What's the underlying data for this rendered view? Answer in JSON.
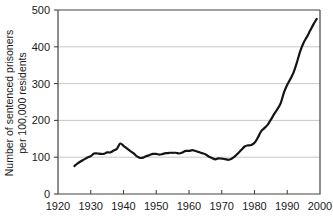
{
  "chart_data": {
    "type": "line",
    "title": "",
    "subtitle": "",
    "xlabel": "",
    "ylabel": "Number of sentenced prisoners per 100,000 residents",
    "ylabel_line1": "Number of sentenced prisoners",
    "ylabel_line2": "per 100,000 residents",
    "xlim": [
      1920,
      2000
    ],
    "ylim": [
      0,
      500
    ],
    "xticks": [
      1920,
      1930,
      1940,
      1950,
      1960,
      1970,
      1980,
      1990,
      2000
    ],
    "yticks": [
      0,
      100,
      200,
      300,
      400,
      500
    ],
    "xtick_labels": [
      "1920",
      "1930",
      "1940",
      "1950",
      "1960",
      "1970",
      "1980",
      "1990",
      "2000"
    ],
    "ytick_labels": [
      "0",
      "100",
      "200",
      "300",
      "400",
      "500"
    ],
    "grid": "horizontal",
    "legend": "none",
    "series": [
      {
        "name": "Sentenced prisoners per 100,000 residents",
        "color": "#141414",
        "line_width": 2.2,
        "x": [
          1925,
          1926,
          1927,
          1928,
          1929,
          1930,
          1931,
          1932,
          1933,
          1934,
          1935,
          1936,
          1937,
          1938,
          1939,
          1940,
          1941,
          1942,
          1943,
          1944,
          1945,
          1946,
          1947,
          1948,
          1949,
          1950,
          1951,
          1952,
          1953,
          1954,
          1955,
          1956,
          1957,
          1958,
          1959,
          1960,
          1961,
          1962,
          1963,
          1964,
          1965,
          1966,
          1967,
          1968,
          1969,
          1970,
          1971,
          1972,
          1973,
          1974,
          1975,
          1976,
          1977,
          1978,
          1979,
          1980,
          1981,
          1982,
          1983,
          1984,
          1985,
          1986,
          1987,
          1988,
          1989,
          1990,
          1991,
          1992,
          1993,
          1994,
          1995,
          1996,
          1997,
          1998,
          1999
        ],
        "values": [
          76,
          83,
          89,
          94,
          99,
          103,
          110,
          110,
          109,
          109,
          113,
          113,
          118,
          123,
          137,
          131,
          124,
          117,
          111,
          103,
          98,
          99,
          103,
          106,
          109,
          109,
          107,
          109,
          111,
          112,
          112,
          112,
          110,
          113,
          117,
          117,
          119,
          117,
          114,
          111,
          108,
          102,
          98,
          94,
          97,
          96,
          95,
          93,
          96,
          102,
          111,
          120,
          129,
          132,
          133,
          139,
          153,
          170,
          179,
          188,
          202,
          217,
          231,
          247,
          276,
          297,
          313,
          332,
          359,
          389,
          411,
          427,
          444,
          461,
          476
        ],
        "note": "values estimated from plotted curve"
      }
    ],
    "annotations": []
  }
}
